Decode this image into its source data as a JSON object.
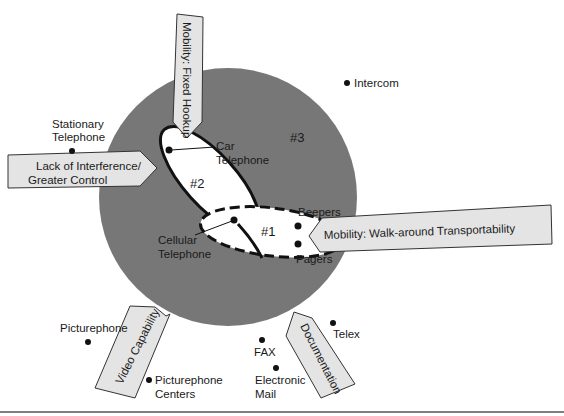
{
  "diagram": {
    "colors": {
      "background": "#ffffff",
      "circle_fill": "#777777",
      "region_fill": "#ffffff",
      "arrow_fill": "#e4e4e4",
      "outline": "#111111",
      "rule": "#555555"
    },
    "regions": {
      "region1": {
        "label": "#1",
        "style": "dashed"
      },
      "region2": {
        "label": "#2",
        "style": "solid"
      },
      "region3": {
        "label": "#3"
      }
    },
    "arrows": {
      "fixed_hookup": "Mobility: Fixed Hookup",
      "interference_line1": "Lack of Interference/",
      "interference_line2": "Greater Control",
      "walk_around": "Mobility: Walk-around Transportability",
      "video": "Video Capability",
      "documentation": "Documentation"
    },
    "points": {
      "intercom": "Intercom",
      "stationary_line1": "Stationary",
      "stationary_line2": "Telephone",
      "car_line1": "Car",
      "car_line2": "Telephone",
      "cellular_line1": "Cellular",
      "cellular_line2": "Telephone",
      "beepers": "Beepers",
      "pagers": "Pagers",
      "picturephone": "Picturephone",
      "picturephone_centers_line1": "Picturephone",
      "picturephone_centers_line2": "Centers",
      "fax": "FAX",
      "email_line1": "Electronic",
      "email_line2": "Mail",
      "telex": "Telex"
    }
  }
}
